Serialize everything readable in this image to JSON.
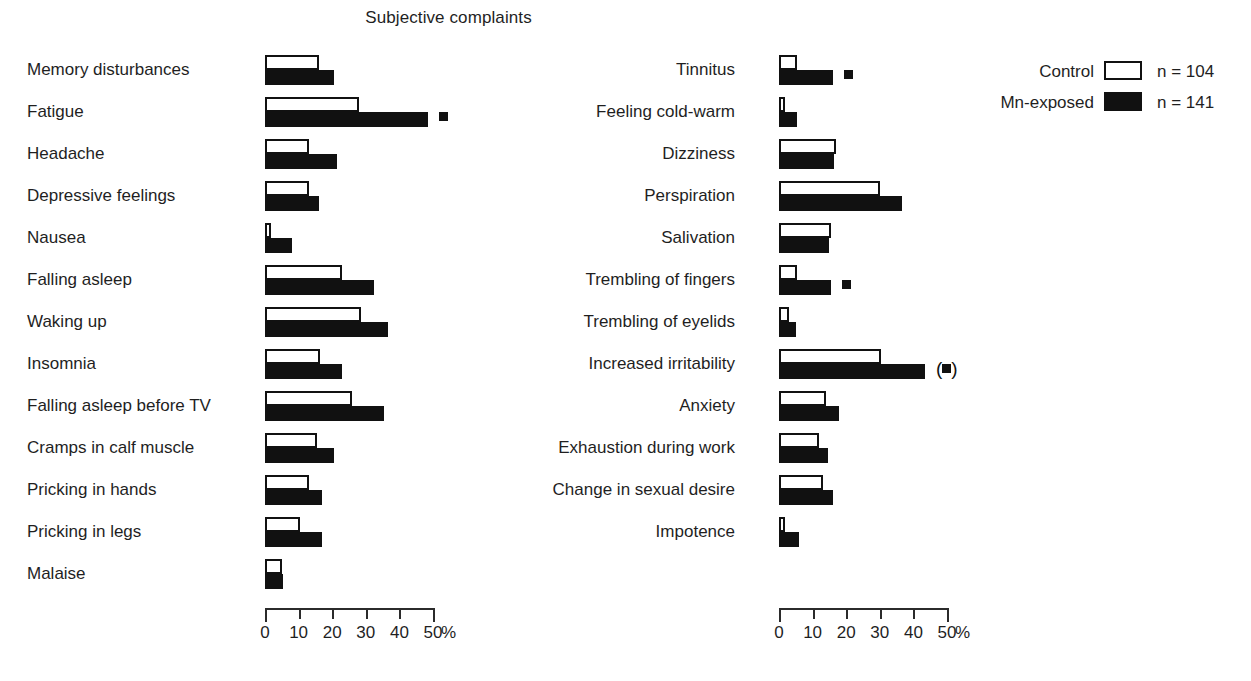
{
  "title": "Subjective complaints",
  "legend": {
    "items": [
      {
        "name": "Control",
        "n": "n = 104",
        "swatch": "white-rect-icon"
      },
      {
        "name": "Mn-exposed",
        "n": "n = 141",
        "swatch": "black-rect-icon"
      }
    ]
  },
  "axis": {
    "ticks": [
      "0",
      "10",
      "20",
      "30",
      "40",
      "50"
    ],
    "unit": "%",
    "min": 0,
    "max": 50
  },
  "chart_data": {
    "type": "bar",
    "title": "Subjective complaints",
    "xlabel": "%",
    "ylabel": "",
    "xlim": [
      0,
      50
    ],
    "grid": false,
    "orientation": "horizontal",
    "legend_position": "top-right",
    "series": [
      {
        "name": "Control",
        "n": 104,
        "color": "#ffffff"
      },
      {
        "name": "Mn-exposed",
        "n": 141,
        "color": "#111111"
      }
    ],
    "panels": [
      {
        "panel": "left",
        "categories": [
          "Memory disturbances",
          "Fatigue",
          "Headache",
          "Depressive feelings",
          "Nausea",
          "Falling asleep",
          "Waking up",
          "Insomnia",
          "Falling asleep before TV",
          "Cramps in calf muscle",
          "Pricking in hands",
          "Pricking in legs",
          "Malaise"
        ],
        "control": [
          16.0,
          28.0,
          13.0,
          13.0,
          1.5,
          23.0,
          28.5,
          16.5,
          26.0,
          15.5,
          13.0,
          10.5,
          5.0
        ],
        "exposed": [
          20.5,
          48.5,
          21.5,
          16.0,
          8.0,
          32.5,
          36.5,
          23.0,
          35.5,
          20.5,
          17.0,
          17.0,
          5.5
        ],
        "significance": [
          "",
          "sig",
          "",
          "",
          "",
          "",
          "",
          "",
          "",
          "",
          "",
          "",
          ""
        ]
      },
      {
        "panel": "right",
        "categories": [
          "Tinnitus",
          "Feeling cold-warm",
          "Dizziness",
          "Perspiration",
          "Salivation",
          "Trembling of fingers",
          "Trembling of eyelids",
          "Increased irritability",
          "Anxiety",
          "Exhaustion during work",
          "Change in sexual desire",
          "Impotence"
        ],
        "control": [
          5.5,
          1.5,
          17.0,
          30.0,
          15.5,
          5.5,
          3.0,
          30.5,
          14.0,
          12.0,
          13.0,
          1.5
        ],
        "exposed": [
          16.0,
          5.5,
          16.5,
          36.5,
          15.0,
          15.5,
          5.0,
          43.5,
          18.0,
          14.5,
          16.0,
          6.0
        ],
        "significance": [
          "sig",
          "",
          "",
          "",
          "",
          "sig",
          "",
          "sig-paren",
          "",
          "",
          "",
          ""
        ]
      }
    ]
  },
  "markers": {
    "significant": "■",
    "borderline_open": "(",
    "borderline_close": ")"
  }
}
